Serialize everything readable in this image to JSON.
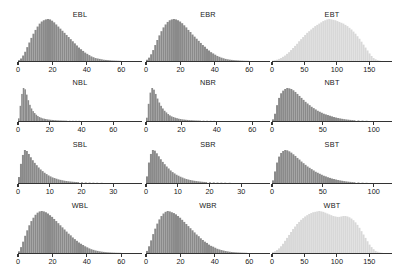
{
  "figure": {
    "background_color": "#ffffff",
    "rows": 4,
    "cols": 3,
    "axis_color": "#333333",
    "bar_color_dark": "#8a8a8a",
    "bar_color_light": "#d8d8d8"
  },
  "chart_data": [
    {
      "type": "bar",
      "title": "EBL",
      "xlabel": "",
      "ylabel": "",
      "xlim": [
        0,
        72
      ],
      "ticks": [
        0,
        20,
        40,
        60
      ],
      "ticklabels": [
        "0",
        "20",
        "40",
        "60"
      ],
      "grid": false,
      "legend": "none",
      "color": "#8a8a8a",
      "bin_width": 1.2,
      "x": [
        0,
        1.2,
        2.4,
        3.6,
        4.8,
        6,
        7.2,
        8.4,
        9.6,
        10.8,
        12,
        13.2,
        14.4,
        15.6,
        16.8,
        18,
        19.2,
        20.4,
        21.6,
        22.8,
        24,
        25.2,
        26.4,
        27.6,
        28.8,
        30,
        31.2,
        32.4,
        33.6,
        34.8,
        36,
        37.2,
        38.4,
        39.6,
        40.8,
        42,
        43.2,
        44.4,
        45.6,
        46.8,
        48,
        49.2,
        50.4,
        51.6,
        52.8,
        54,
        55.2,
        56.4,
        57.6,
        58.8,
        60
      ],
      "values": [
        2,
        6,
        13,
        22,
        33,
        44,
        55,
        65,
        74,
        82,
        89,
        94,
        97,
        99,
        100,
        99,
        96,
        92,
        87,
        82,
        77,
        72,
        67,
        62,
        57,
        52,
        47,
        42,
        37,
        32,
        28,
        24,
        20,
        17,
        14,
        11,
        9,
        7,
        6,
        5,
        4,
        3,
        2.5,
        2,
        1.6,
        1.2,
        1,
        0.8,
        0.6,
        0.4,
        0.3
      ]
    },
    {
      "type": "bar",
      "title": "EBR",
      "xlabel": "",
      "ylabel": "",
      "xlim": [
        0,
        72
      ],
      "ticks": [
        0,
        20,
        40,
        60
      ],
      "ticklabels": [
        "0",
        "20",
        "40",
        "60"
      ],
      "grid": false,
      "legend": "none",
      "color": "#8a8a8a",
      "bin_width": 1.2,
      "x": [
        0,
        1.2,
        2.4,
        3.6,
        4.8,
        6,
        7.2,
        8.4,
        9.6,
        10.8,
        12,
        13.2,
        14.4,
        15.6,
        16.8,
        18,
        19.2,
        20.4,
        21.6,
        22.8,
        24,
        25.2,
        26.4,
        27.6,
        28.8,
        30,
        31.2,
        32.4,
        33.6,
        34.8,
        36,
        37.2,
        38.4,
        39.6,
        40.8,
        42,
        43.2,
        44.4,
        45.6,
        46.8,
        48,
        49.2,
        50.4,
        51.6,
        52.8,
        54,
        55.2,
        56.4,
        57.6,
        58.8,
        60
      ],
      "values": [
        3,
        8,
        16,
        26,
        38,
        50,
        61,
        71,
        80,
        87,
        93,
        97,
        99,
        100,
        99,
        97,
        94,
        90,
        85,
        80,
        74,
        69,
        63,
        58,
        53,
        48,
        43,
        38,
        34,
        29,
        25,
        21,
        18,
        15,
        12,
        10,
        8,
        6.5,
        5,
        4,
        3.2,
        2.6,
        2,
        1.6,
        1.3,
        1,
        0.8,
        0.6,
        0.5,
        0.4,
        0.3
      ]
    },
    {
      "type": "bar",
      "title": "EBT",
      "xlabel": "",
      "ylabel": "",
      "xlim": [
        0,
        185
      ],
      "ticks": [
        0,
        50,
        100,
        150
      ],
      "ticklabels": [
        "0",
        "50",
        "100",
        "150"
      ],
      "grid": false,
      "legend": "none",
      "color": "#d8d8d8",
      "bin_width": 3.1,
      "x": [
        0,
        3.1,
        6.2,
        9.3,
        12.4,
        15.5,
        18.6,
        21.7,
        24.8,
        27.9,
        31,
        34.1,
        37.2,
        40.3,
        43.4,
        46.5,
        49.6,
        52.7,
        55.8,
        58.9,
        62,
        65.1,
        68.2,
        71.3,
        74.4,
        77.5,
        80.6,
        83.7,
        86.8,
        89.9,
        93,
        96.1,
        99.2,
        102.3,
        105.4,
        108.5,
        111.6,
        114.7,
        117.8,
        120.9,
        124,
        127.1,
        130.2,
        133.3,
        136.4,
        139.5,
        142.6,
        145.7,
        148.8,
        151.9,
        155,
        158.1,
        161.2,
        164.3
      ],
      "values": [
        1,
        2,
        3,
        5,
        7,
        10,
        13,
        17,
        21,
        26,
        31,
        36,
        41,
        47,
        52,
        57,
        62,
        67,
        71,
        75,
        79,
        83,
        86,
        89,
        92,
        95,
        97,
        99,
        100,
        99,
        98,
        97,
        95,
        93,
        91,
        89,
        86,
        83,
        79,
        75,
        70,
        65,
        59,
        53,
        46,
        39,
        32,
        25,
        18,
        12,
        7,
        4,
        2,
        1
      ]
    },
    {
      "type": "bar",
      "title": "NBL",
      "xlabel": "",
      "ylabel": "",
      "xlim": [
        0,
        78
      ],
      "ticks": [
        0,
        20,
        40,
        60
      ],
      "ticklabels": [
        "0",
        "20",
        "40",
        "60"
      ],
      "grid": false,
      "legend": "none",
      "color": "#8a8a8a",
      "bin_width": 1.0,
      "x": [
        0,
        1,
        2,
        3,
        4,
        5,
        6,
        7,
        8,
        9,
        10,
        11,
        12,
        13,
        14,
        15,
        16,
        17,
        18,
        19,
        20,
        21,
        22,
        23,
        24,
        25,
        26,
        27,
        28,
        29,
        30,
        32,
        34,
        36,
        38,
        40,
        44,
        48,
        52,
        56,
        60
      ],
      "values": [
        8,
        46,
        82,
        100,
        96,
        80,
        63,
        49,
        38,
        30,
        24,
        19,
        15,
        12,
        10,
        8,
        7,
        6,
        5,
        4.3,
        3.7,
        3.2,
        2.8,
        2.4,
        2.1,
        1.8,
        1.6,
        1.4,
        1.2,
        1.1,
        1,
        0.8,
        0.7,
        0.6,
        0.5,
        0.4,
        0.3,
        0.25,
        0.2,
        0.15,
        0.1
      ]
    },
    {
      "type": "bar",
      "title": "NBR",
      "xlabel": "",
      "ylabel": "",
      "xlim": [
        0,
        70
      ],
      "ticks": [
        0,
        20,
        40,
        60
      ],
      "ticklabels": [
        "0",
        "20",
        "40",
        "60"
      ],
      "grid": false,
      "legend": "none",
      "color": "#8a8a8a",
      "bin_width": 1.0,
      "x": [
        0,
        1,
        2,
        3,
        4,
        5,
        6,
        7,
        8,
        9,
        10,
        11,
        12,
        13,
        14,
        15,
        16,
        17,
        18,
        19,
        20,
        21,
        22,
        23,
        24,
        25,
        26,
        27,
        28,
        29,
        30,
        32,
        34,
        36,
        38,
        40,
        44,
        48,
        52,
        56,
        60
      ],
      "values": [
        10,
        52,
        86,
        100,
        95,
        82,
        68,
        56,
        46,
        38,
        31,
        26,
        21,
        17,
        14,
        12,
        10,
        8.5,
        7,
        6,
        5,
        4.3,
        3.7,
        3.2,
        2.7,
        2.3,
        2,
        1.7,
        1.5,
        1.3,
        1.1,
        0.9,
        0.75,
        0.6,
        0.5,
        0.4,
        0.3,
        0.25,
        0.2,
        0.15,
        0.1
      ]
    },
    {
      "type": "bar",
      "title": "NBT",
      "xlabel": "",
      "ylabel": "",
      "xlim": [
        0,
        118
      ],
      "ticks": [
        0,
        50,
        100
      ],
      "ticklabels": [
        "0",
        "50",
        "100"
      ],
      "grid": false,
      "legend": "none",
      "color": "#8a8a8a",
      "bin_width": 2.0,
      "x": [
        0,
        2,
        4,
        6,
        8,
        10,
        12,
        14,
        16,
        18,
        20,
        22,
        24,
        26,
        28,
        30,
        32,
        34,
        36,
        38,
        40,
        42,
        44,
        46,
        48,
        50,
        52,
        54,
        56,
        58,
        60,
        62,
        64,
        66,
        68,
        70,
        72,
        74,
        76,
        78,
        80,
        84,
        88,
        92,
        96,
        100
      ],
      "values": [
        5,
        22,
        48,
        70,
        84,
        92,
        97,
        100,
        99,
        97,
        93,
        88,
        82,
        76,
        70,
        64,
        58,
        53,
        48,
        43,
        39,
        35,
        31,
        28,
        25,
        22,
        20,
        18,
        16,
        14,
        12,
        10.5,
        9,
        7.8,
        6.6,
        5.6,
        4.7,
        4,
        3.3,
        2.8,
        2.3,
        1.6,
        1.1,
        0.7,
        0.4,
        0.2
      ]
    },
    {
      "type": "bar",
      "title": "SBL",
      "xlabel": "",
      "ylabel": "",
      "xlim": [
        0,
        39
      ],
      "ticks": [
        0,
        10,
        20,
        30
      ],
      "ticklabels": [
        "0",
        "10",
        "20",
        "30"
      ],
      "grid": false,
      "legend": "none",
      "color": "#8a8a8a",
      "bin_width": 0.62,
      "x": [
        0,
        0.62,
        1.24,
        1.86,
        2.48,
        3.1,
        3.72,
        4.34,
        4.96,
        5.58,
        6.2,
        6.82,
        7.44,
        8.06,
        8.68,
        9.3,
        9.92,
        10.54,
        11.16,
        11.78,
        12.4,
        13.02,
        13.64,
        14.26,
        14.88,
        15.5,
        16.12,
        16.74,
        17.36,
        17.98,
        18.6,
        19.8,
        21,
        22.2,
        23.4,
        24.6,
        26,
        28,
        30
      ],
      "values": [
        18,
        58,
        85,
        100,
        97,
        88,
        78,
        69,
        61,
        54,
        47,
        41,
        36,
        31,
        27,
        23,
        20,
        17,
        15,
        13,
        11,
        9.5,
        8.2,
        7,
        6,
        5.2,
        4.5,
        3.9,
        3.4,
        3,
        2.6,
        2,
        1.6,
        1.3,
        1,
        0.8,
        0.6,
        0.4,
        0.25
      ]
    },
    {
      "type": "bar",
      "title": "SBR",
      "xlabel": "",
      "ylabel": "",
      "xlim": [
        0,
        39
      ],
      "ticks": [
        0,
        10,
        20,
        30
      ],
      "ticklabels": [
        "0",
        "10",
        "20",
        "30"
      ],
      "grid": false,
      "legend": "none",
      "color": "#8a8a8a",
      "bin_width": 0.62,
      "x": [
        0,
        0.62,
        1.24,
        1.86,
        2.48,
        3.1,
        3.72,
        4.34,
        4.96,
        5.58,
        6.2,
        6.82,
        7.44,
        8.06,
        8.68,
        9.3,
        9.92,
        10.54,
        11.16,
        11.78,
        12.4,
        13.02,
        13.64,
        14.26,
        14.88,
        15.5,
        16.12,
        16.74,
        17.36,
        17.98,
        18.6,
        19.8,
        21,
        22.2,
        23.4,
        24.6,
        26,
        28,
        30
      ],
      "values": [
        20,
        62,
        88,
        100,
        98,
        90,
        81,
        72,
        64,
        57,
        50,
        44,
        38,
        33,
        29,
        25,
        22,
        19,
        16.5,
        14,
        12,
        10.5,
        9,
        7.8,
        6.7,
        5.8,
        5,
        4.3,
        3.7,
        3.2,
        2.8,
        2.2,
        1.8,
        1.4,
        1.1,
        0.9,
        0.7,
        0.45,
        0.3
      ]
    },
    {
      "type": "bar",
      "title": "SBT",
      "xlabel": "",
      "ylabel": "",
      "xlim": [
        0,
        118
      ],
      "ticks": [
        0,
        50,
        100
      ],
      "ticklabels": [
        "0",
        "50",
        "100"
      ],
      "grid": false,
      "legend": "none",
      "color": "#8a8a8a",
      "bin_width": 2.0,
      "x": [
        0,
        2,
        4,
        6,
        8,
        10,
        12,
        14,
        16,
        18,
        20,
        22,
        24,
        26,
        28,
        30,
        32,
        34,
        36,
        38,
        40,
        42,
        44,
        46,
        48,
        50,
        52,
        54,
        56,
        58,
        60,
        62,
        64,
        66,
        68,
        70,
        72,
        74,
        76,
        78,
        80,
        84,
        88,
        92,
        96,
        100
      ],
      "values": [
        8,
        35,
        62,
        80,
        91,
        97,
        100,
        99,
        96,
        92,
        87,
        82,
        76,
        71,
        65,
        60,
        55,
        50,
        46,
        42,
        38,
        34,
        31,
        28,
        25,
        22,
        20,
        17.5,
        15.5,
        13.5,
        12,
        10.5,
        9,
        7.8,
        6.7,
        5.7,
        4.8,
        4,
        3.4,
        2.8,
        2.3,
        1.6,
        1,
        0.6,
        0.35,
        0.2
      ]
    },
    {
      "type": "bar",
      "title": "WBL",
      "xlabel": "",
      "ylabel": "",
      "xlim": [
        0,
        72
      ],
      "ticks": [
        0,
        20,
        40,
        60
      ],
      "ticklabels": [
        "0",
        "20",
        "40",
        "60"
      ],
      "grid": false,
      "legend": "none",
      "color": "#8a8a8a",
      "bin_width": 1.2,
      "x": [
        0,
        1.2,
        2.4,
        3.6,
        4.8,
        6,
        7.2,
        8.4,
        9.6,
        10.8,
        12,
        13.2,
        14.4,
        15.6,
        16.8,
        18,
        19.2,
        20.4,
        21.6,
        22.8,
        24,
        25.2,
        26.4,
        27.6,
        28.8,
        30,
        31.2,
        32.4,
        33.6,
        34.8,
        36,
        37.2,
        38.4,
        39.6,
        40.8,
        42,
        43.2,
        44.4,
        45.6,
        46.8,
        48,
        49.2,
        50.4,
        51.6,
        52.8,
        54,
        55.2,
        56.4,
        57.6,
        58.8,
        60
      ],
      "values": [
        4,
        14,
        27,
        41,
        54,
        66,
        76,
        84,
        91,
        96,
        99,
        100,
        99,
        97,
        94,
        90,
        86,
        81,
        76,
        71,
        66,
        61,
        56,
        51,
        46,
        42,
        37,
        33,
        29,
        25,
        22,
        19,
        16,
        13.5,
        11,
        9,
        7.5,
        6,
        5,
        4,
        3.2,
        2.6,
        2,
        1.6,
        1.3,
        1,
        0.8,
        0.6,
        0.5,
        0.4,
        0.3
      ]
    },
    {
      "type": "bar",
      "title": "WBR",
      "xlabel": "",
      "ylabel": "",
      "xlim": [
        0,
        72
      ],
      "ticks": [
        0,
        20,
        40,
        60
      ],
      "ticklabels": [
        "0",
        "20",
        "40",
        "60"
      ],
      "grid": false,
      "legend": "none",
      "color": "#8a8a8a",
      "bin_width": 1.2,
      "x": [
        0,
        1.2,
        2.4,
        3.6,
        4.8,
        6,
        7.2,
        8.4,
        9.6,
        10.8,
        12,
        13.2,
        14.4,
        15.6,
        16.8,
        18,
        19.2,
        20.4,
        21.6,
        22.8,
        24,
        25.2,
        26.4,
        27.6,
        28.8,
        30,
        31.2,
        32.4,
        33.6,
        34.8,
        36,
        37.2,
        38.4,
        39.6,
        40.8,
        42,
        43.2,
        44.4,
        45.6,
        46.8,
        48,
        49.2,
        50.4,
        51.6,
        52.8,
        54,
        55.2,
        56.4,
        57.6,
        58.8,
        60
      ],
      "values": [
        5,
        16,
        30,
        45,
        58,
        70,
        80,
        88,
        94,
        98,
        100,
        99,
        97,
        95,
        92,
        88,
        84,
        79,
        74,
        69,
        64,
        59,
        54,
        49,
        44,
        40,
        35,
        31,
        27,
        24,
        20,
        17,
        15,
        12.5,
        10,
        8.5,
        7,
        5.8,
        4.7,
        3.8,
        3,
        2.4,
        1.9,
        1.5,
        1.2,
        0.95,
        0.75,
        0.6,
        0.45,
        0.35,
        0.25
      ]
    },
    {
      "type": "bar",
      "title": "WBT",
      "xlabel": "",
      "ylabel": "",
      "xlim": [
        0,
        185
      ],
      "ticks": [
        0,
        50,
        100,
        150
      ],
      "ticklabels": [
        "0",
        "50",
        "100",
        "150"
      ],
      "grid": false,
      "legend": "none",
      "color": "#d8d8d8",
      "bin_width": 3.1,
      "x": [
        0,
        3.1,
        6.2,
        9.3,
        12.4,
        15.5,
        18.6,
        21.7,
        24.8,
        27.9,
        31,
        34.1,
        37.2,
        40.3,
        43.4,
        46.5,
        49.6,
        52.7,
        55.8,
        58.9,
        62,
        65.1,
        68.2,
        71.3,
        74.4,
        77.5,
        80.6,
        83.7,
        86.8,
        89.9,
        93,
        96.1,
        99.2,
        102.3,
        105.4,
        108.5,
        111.6,
        114.7,
        117.8,
        120.9,
        124,
        127.1,
        130.2,
        133.3,
        136.4,
        139.5,
        142.6,
        145.7,
        148.8,
        151.9,
        155,
        158.1,
        161.2,
        164.3,
        167.4
      ],
      "values": [
        2,
        4,
        7,
        11,
        16,
        22,
        29,
        36,
        43,
        50,
        57,
        63,
        69,
        74,
        79,
        83,
        87,
        90,
        93,
        95,
        97,
        98,
        99,
        100,
        99,
        98,
        96,
        94,
        92,
        90,
        88,
        87,
        86,
        86,
        87,
        88,
        88,
        87,
        85,
        82,
        78,
        73,
        67,
        60,
        52,
        44,
        36,
        28,
        20,
        14,
        9,
        5,
        3,
        1.5,
        0.7
      ]
    }
  ]
}
